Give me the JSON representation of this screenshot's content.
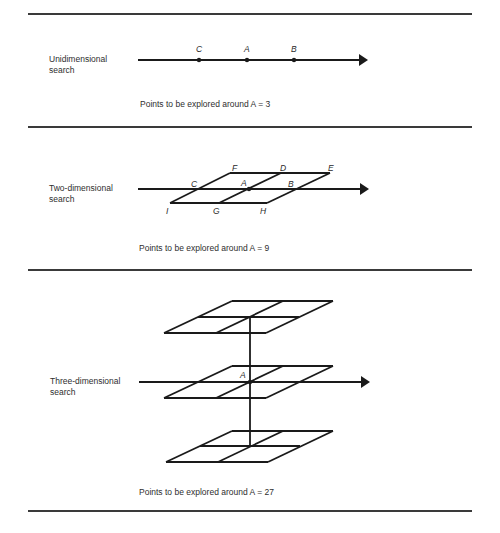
{
  "figure": {
    "panels": [
      {
        "id": "uni",
        "label_line1": "Unidimensional",
        "label_line2": "search",
        "caption": "Points to be explored around A = 3",
        "points": [
          {
            "name": "C",
            "x": 199
          },
          {
            "name": "A",
            "x": 247
          },
          {
            "name": "B",
            "x": 294
          }
        ]
      },
      {
        "id": "two",
        "label_line1": "Two-dimensional",
        "label_line2": "search",
        "caption": "Points to be explored around A = 9",
        "points": {
          "F": "F",
          "D": "D",
          "E": "E",
          "C": "C",
          "A": "A",
          "B": "B",
          "I": "I",
          "G": "G",
          "H": "H"
        }
      },
      {
        "id": "three",
        "label_line1": "Three-dimensional",
        "label_line2": "search",
        "caption": "Points to be explored around A = 27",
        "points": {
          "A": "A"
        }
      }
    ],
    "colors": {
      "ink": "#1a1a1a",
      "background": "#ffffff"
    }
  }
}
